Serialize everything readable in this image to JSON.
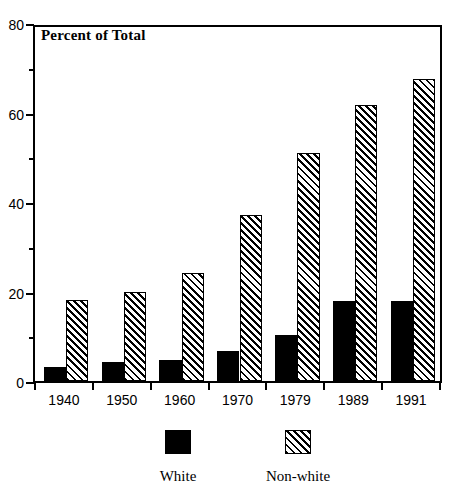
{
  "chart_data": {
    "type": "bar",
    "title": "Percent of Total",
    "xlabel": "",
    "ylabel": "",
    "ylim": [
      0,
      80
    ],
    "ytick_labels": [
      "0",
      "20",
      "40",
      "60",
      "80"
    ],
    "ytick_values": [
      0,
      20,
      40,
      60,
      80
    ],
    "yminor_values": [
      10,
      30,
      50,
      70
    ],
    "grid": false,
    "legend_position": "bottom",
    "categories": [
      "1940",
      "1950",
      "1960",
      "1970",
      "1979",
      "1989",
      "1991"
    ],
    "series": [
      {
        "name": "White",
        "fill": "solid-black",
        "color": "#000000",
        "values": [
          3.2,
          4.2,
          4.6,
          6.6,
          10.2,
          17.9,
          17.9
        ]
      },
      {
        "name": "Non-white",
        "fill": "diagonal-hatch",
        "color": "#000000",
        "values": [
          18.1,
          19.8,
          24.1,
          37.2,
          51.0,
          61.7,
          67.6
        ]
      }
    ]
  },
  "legend": {
    "items": [
      {
        "label": "White",
        "swatch": "solid-black-square"
      },
      {
        "label": "Non-white",
        "swatch": "hatched-square"
      }
    ]
  }
}
